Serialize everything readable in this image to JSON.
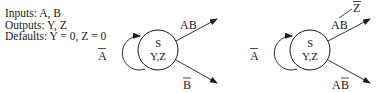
{
  "spec": {
    "inputs": "Inputs: A, B",
    "outputs": "Outputs: Y, Z",
    "defaults": "Defaults: Y = 0, Z = 0"
  },
  "diagram_left": {
    "state": {
      "name": "S",
      "outputs": "Y,Z"
    },
    "self_loop": {
      "label": "A",
      "label_overbar": true
    },
    "transitions": [
      {
        "label": "AB",
        "overbar": "none",
        "direction": "up-right"
      },
      {
        "label": "B",
        "overbar": "B",
        "direction": "down-right"
      }
    ]
  },
  "diagram_right": {
    "state": {
      "name": "S",
      "outputs": "Y,Z"
    },
    "self_loop": {
      "label": "A",
      "label_overbar": true
    },
    "transitions": [
      {
        "label": "AB",
        "overbar": "none",
        "direction": "up-right",
        "output_action": "Z",
        "output_action_overbar": true
      },
      {
        "label_A": "A",
        "label_B": "B",
        "overbar": "B",
        "direction": "down-right"
      }
    ]
  },
  "colors": {
    "stroke": "#1a1a1a",
    "background": "#ffffff"
  }
}
